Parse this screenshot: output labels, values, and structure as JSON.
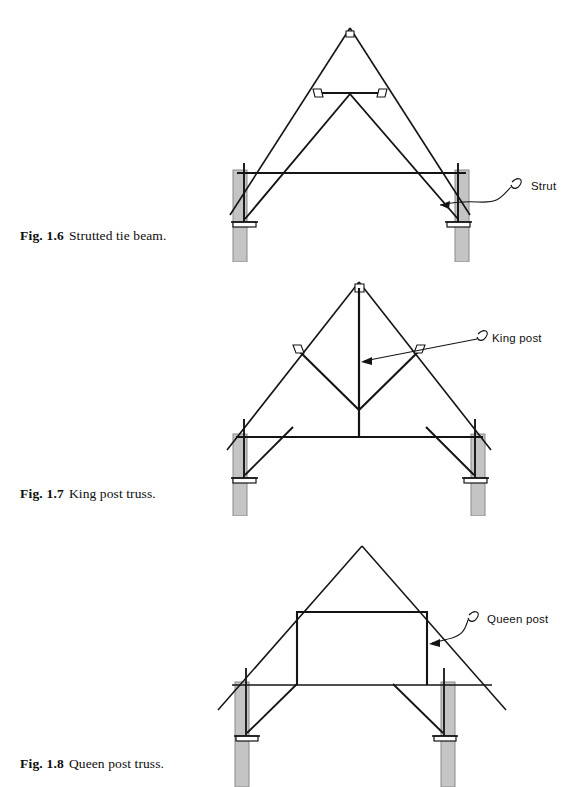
{
  "page": {
    "background_color": "#ffffff",
    "ink_color": "#141414",
    "wall_fill_color": "#c4c4c4",
    "wall_edge_color": "#8a8a8a"
  },
  "figures": [
    {
      "id": "1.6",
      "number_label": "Fig. 1.6",
      "caption_text": "Strutted tie beam.",
      "annotation": {
        "label": "Strut",
        "name": "strut"
      },
      "members": [
        "rafter-left",
        "rafter-right",
        "collar-beam",
        "tie-beam",
        "strut-left",
        "strut-right",
        "post-left",
        "post-right",
        "wall-left",
        "wall-right",
        "base-plate-left",
        "base-plate-right"
      ]
    },
    {
      "id": "1.7",
      "number_label": "Fig. 1.7",
      "caption_text": "King post truss.",
      "annotation": {
        "label": "King post",
        "name": "king-post"
      },
      "members": [
        "rafter-left",
        "rafter-right",
        "king-post",
        "brace-left",
        "brace-right",
        "tie-beam",
        "strut-left",
        "strut-right",
        "post-left",
        "post-right",
        "wall-left",
        "wall-right",
        "base-plate-left",
        "base-plate-right"
      ]
    },
    {
      "id": "1.8",
      "number_label": "Fig. 1.8",
      "caption_text": "Queen post truss.",
      "annotation": {
        "label": "Queen post",
        "name": "queen-post"
      },
      "members": [
        "rafter-left",
        "rafter-right",
        "collar-beam",
        "queen-post-left",
        "queen-post-right",
        "tie-beam",
        "strut-left",
        "strut-right",
        "post-left",
        "post-right",
        "wall-left",
        "wall-right",
        "base-plate-left",
        "base-plate-right"
      ]
    }
  ]
}
